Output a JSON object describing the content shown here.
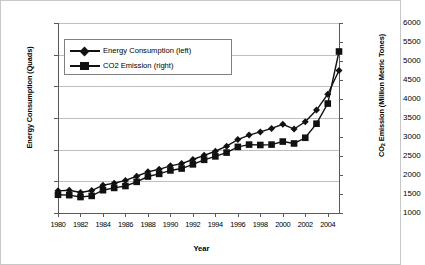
{
  "chart_data": {
    "type": "line",
    "title": "",
    "xlabel": "Year",
    "ylabel": "Energy Consumption (Quads)",
    "y2label": "CO2 Emission (Million Metric Tones)",
    "grid": true,
    "legend_position": "upper-left-inside",
    "x": [
      1980,
      1981,
      1982,
      1983,
      1984,
      1985,
      1986,
      1987,
      1988,
      1989,
      1990,
      1991,
      1992,
      1993,
      1994,
      1995,
      1996,
      1997,
      1998,
      1999,
      2000,
      2001,
      2002,
      2003,
      2004,
      2005
    ],
    "xlim": [
      1980,
      2005
    ],
    "xticks": [
      1980,
      1982,
      1984,
      1986,
      1988,
      1990,
      1992,
      1994,
      1996,
      1998,
      2000,
      2002,
      2004
    ],
    "ylim": [
      10,
      70
    ],
    "yticks": [
      10,
      20,
      30,
      40,
      50,
      60,
      70
    ],
    "y2lim": [
      1000,
      6000
    ],
    "y2ticks": [
      1000,
      1500,
      2000,
      2500,
      3000,
      3500,
      4000,
      4500,
      5000,
      5500,
      6000
    ],
    "series": [
      {
        "name": "Energy Consumption (left)",
        "axis": "left",
        "marker": "diamond",
        "color": "#111111",
        "values": [
          17.0,
          17.2,
          16.5,
          17.1,
          18.8,
          19.4,
          20.3,
          21.6,
          23.0,
          23.8,
          24.9,
          25.6,
          26.9,
          28.2,
          29.5,
          31.1,
          33.2,
          34.6,
          35.6,
          36.7,
          38.0,
          36.5,
          38.8,
          42.5,
          47.5,
          55.0
        ]
      },
      {
        "name": "CO2 Emission (right)",
        "axis": "right",
        "marker": "square",
        "color": "#111111",
        "values": [
          1480,
          1470,
          1420,
          1450,
          1600,
          1660,
          1710,
          1820,
          1960,
          2030,
          2120,
          2170,
          2280,
          2400,
          2490,
          2590,
          2740,
          2800,
          2790,
          2800,
          2880,
          2830,
          2980,
          3350,
          3880,
          5250
        ]
      }
    ]
  },
  "legend": {
    "items": [
      {
        "label": "Energy Consumption (left)",
        "marker": "diamond"
      },
      {
        "label": "CO2 Emission (right)",
        "marker": "square"
      }
    ]
  },
  "axis_titles": {
    "left_prefix": "Energy Consumption (Quads)",
    "right_prefix": "CO",
    "right_sub": "2",
    "right_suffix": " Emission (Million Metric Tones)",
    "x": "Year"
  }
}
